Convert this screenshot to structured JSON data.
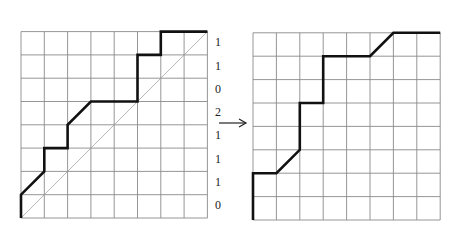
{
  "diagram": {
    "grid_size": 8,
    "left_panel": {
      "origin": [
        21,
        218
      ],
      "cell": 23.3,
      "diagonal": true,
      "path": [
        [
          0,
          0
        ],
        [
          0,
          1
        ],
        [
          1,
          2
        ],
        [
          1,
          3
        ],
        [
          2,
          3
        ],
        [
          2,
          4
        ],
        [
          3,
          5
        ],
        [
          4,
          5
        ],
        [
          5,
          5
        ],
        [
          5,
          7
        ],
        [
          6,
          7
        ],
        [
          6,
          8
        ],
        [
          8,
          8
        ]
      ],
      "row_labels_top_to_bottom": [
        "1",
        "1",
        "0",
        "2",
        "1",
        "1",
        "1",
        "0"
      ]
    },
    "arrow": {
      "from": [
        219,
        123
      ],
      "to": [
        246,
        123
      ]
    },
    "right_panel": {
      "origin": [
        253,
        220
      ],
      "cell": 23.4,
      "diagonal": false,
      "path": [
        [
          0,
          0
        ],
        [
          0,
          2
        ],
        [
          1,
          2
        ],
        [
          2,
          3
        ],
        [
          2,
          5
        ],
        [
          3,
          5
        ],
        [
          3,
          7
        ],
        [
          4,
          7
        ],
        [
          5,
          7
        ],
        [
          6,
          8
        ],
        [
          8,
          8
        ]
      ]
    }
  }
}
